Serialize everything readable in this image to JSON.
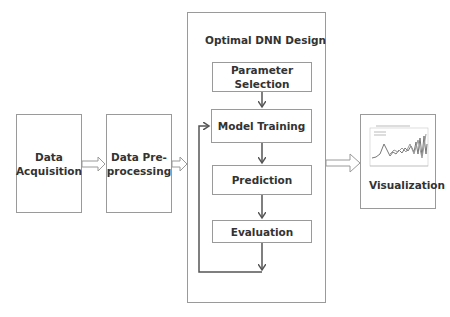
{
  "diagram": {
    "nodes": {
      "data_acquisition": "Data Acquisition",
      "data_preprocessing": "Data Pre-processing",
      "dnn_group_title": "Optimal DNN Design",
      "parameter_selection": "Parameter Selection",
      "model_training": "Model Training",
      "prediction": "Prediction",
      "evaluation": "Evaluation",
      "visualization": "Visualization"
    },
    "edges": [
      {
        "from": "Data Acquisition",
        "to": "Data Pre-processing",
        "style": "hollow-arrow"
      },
      {
        "from": "Data Pre-processing",
        "to": "Optimal DNN Design",
        "style": "hollow-arrow"
      },
      {
        "from": "Parameter Selection",
        "to": "Model Training",
        "style": "arrow"
      },
      {
        "from": "Model Training",
        "to": "Prediction",
        "style": "arrow"
      },
      {
        "from": "Prediction",
        "to": "Evaluation",
        "style": "arrow"
      },
      {
        "from": "Evaluation",
        "to": "Model Training",
        "style": "feedback-loop"
      },
      {
        "from": "Optimal DNN Design",
        "to": "Visualization",
        "style": "hollow-arrow"
      }
    ],
    "colors": {
      "border": "#9a9a9a",
      "arrow": "#555555",
      "text": "#333333"
    }
  }
}
